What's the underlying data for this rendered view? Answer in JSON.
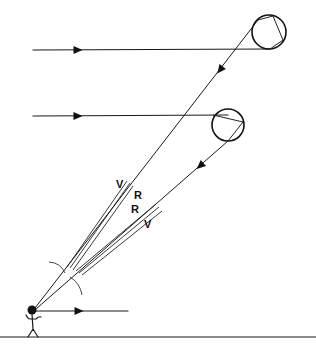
{
  "diagram": {
    "title": "",
    "type": "rainbow-formation",
    "colors": {
      "ink": "#111111",
      "background": "#ffffff"
    },
    "incoming_rays": [
      {
        "id": "sun-ray-top",
        "from": [
          33,
          50
        ],
        "to": [
          270,
          49
        ],
        "arrow_at": [
          78,
          50
        ]
      },
      {
        "id": "sun-ray-middle",
        "from": [
          33,
          116
        ],
        "to": [
          228,
          115
        ],
        "arrow_at": [
          78,
          116
        ]
      },
      {
        "id": "sun-ray-observer",
        "from": [
          36,
          311
        ],
        "to": [
          128,
          311
        ],
        "arrow_at": [
          79,
          311
        ]
      }
    ],
    "droplets": [
      {
        "id": "droplet-upper",
        "center": [
          269,
          32
        ],
        "radius": 17,
        "path": [
          [
            270,
            49
          ],
          [
            283,
            40
          ],
          [
            273,
            16
          ],
          [
            258,
            20
          ]
        ]
      },
      {
        "id": "droplet-lower",
        "center": [
          228,
          125
        ],
        "radius": 16,
        "path": [
          [
            213,
            115
          ],
          [
            243,
            122
          ],
          [
            228,
            141
          ]
        ]
      }
    ],
    "exit_rays": [
      {
        "id": "exit-ray-upper",
        "from": [
          258,
          20
        ],
        "to": [
          35,
          308
        ],
        "arrow_at": [
          220,
          70
        ]
      },
      {
        "id": "exit-ray-lower",
        "from": [
          228,
          141
        ],
        "to": [
          36,
          309
        ],
        "arrow_at": [
          200,
          166
        ]
      }
    ],
    "spectrum_bands": [
      {
        "id": "primary-band-upper",
        "lines": [
          [
            [
              127,
              181
            ],
            [
              67,
              267
            ]
          ],
          [
            [
              130,
              183
            ],
            [
              70,
              268
            ]
          ],
          [
            [
              133,
              186
            ],
            [
              73,
              270
            ]
          ]
        ]
      },
      {
        "id": "secondary-band-lower",
        "lines": [
          [
            [
              156,
              204
            ],
            [
              76,
              271
            ]
          ],
          [
            [
              159,
              207
            ],
            [
              79,
              273
            ]
          ],
          [
            [
              162,
              211
            ],
            [
              82,
              275
            ]
          ]
        ]
      }
    ],
    "labels": [
      {
        "id": "label-v-upper",
        "text": "V",
        "x": 116,
        "y": 188
      },
      {
        "id": "label-r-upper",
        "text": "R",
        "x": 134,
        "y": 199
      },
      {
        "id": "label-r-lower",
        "text": "R",
        "x": 131,
        "y": 213
      },
      {
        "id": "label-v-lower",
        "text": "V",
        "x": 144,
        "y": 228
      }
    ],
    "angle_arcs": [
      {
        "id": "arc-primary",
        "from": [
          49,
          262
        ],
        "to": [
          65,
          273
        ],
        "bulge": 6
      },
      {
        "id": "arc-secondary",
        "from": [
          70,
          277
        ],
        "to": [
          82,
          295
        ],
        "bulge": 5
      }
    ],
    "observer": {
      "head": [
        32,
        310
      ],
      "head_radius": 4.5
    },
    "ground": {
      "y": 337,
      "x1": 0,
      "x2": 316
    }
  }
}
